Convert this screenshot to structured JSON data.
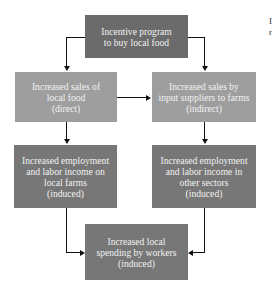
{
  "diagram": {
    "nodes": [
      {
        "id": "incentive",
        "label": "Incentive program\nto buy local food"
      },
      {
        "id": "direct",
        "label": "Increased sales of\nlocal food\n(direct)"
      },
      {
        "id": "indirect",
        "label": "Increased sales by\ninput suppliers to farms\n(indirect)"
      },
      {
        "id": "farm_employment",
        "label": "Increased employment\nand labor income on\nlocal farms\n(induced)"
      },
      {
        "id": "other_employment",
        "label": "Increased employment\nand labor income in\nother sectors\n(induced)"
      },
      {
        "id": "local_spending",
        "label": "Increased local\nspending by workers\n(induced)"
      }
    ],
    "edges": [
      {
        "from": "incentive",
        "to": "direct"
      },
      {
        "from": "incentive",
        "to": "indirect"
      },
      {
        "from": "direct",
        "to": "indirect"
      },
      {
        "from": "direct",
        "to": "farm_employment"
      },
      {
        "from": "indirect",
        "to": "other_employment"
      },
      {
        "from": "farm_employment",
        "to": "local_spending"
      },
      {
        "from": "other_employment",
        "to": "local_spending"
      }
    ],
    "colors": {
      "dark_box": "#6b6b6b",
      "light_box": "#9e9e9e",
      "text": "#f2f2f2",
      "arrow": "#111111"
    }
  },
  "edge_fragment": {
    "line1": "I",
    "line2": "r"
  }
}
